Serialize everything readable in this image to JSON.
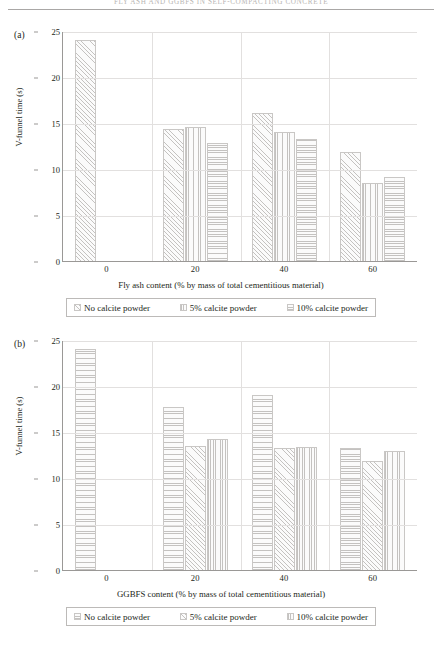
{
  "page": {
    "running_head": "FLY ASH AND GGBFS IN SELF-COMPACTING CONCRETE"
  },
  "chart_data": [
    {
      "type": "bar",
      "panel_label": "(a)",
      "title": "",
      "xlabel": "Fly ash content (% by mass of total cementitious material)",
      "ylabel": "V-funnel time (s)",
      "categories": [
        "0",
        "20",
        "40",
        "60"
      ],
      "ylim": [
        0,
        25
      ],
      "yticks": [
        0,
        5,
        10,
        15,
        20,
        25
      ],
      "grid": true,
      "legend_position": "below",
      "series": [
        {
          "name": "No calcite powder",
          "pattern": "diagonal",
          "values": [
            24.0,
            14.4,
            16.1,
            11.8
          ]
        },
        {
          "name": "5% calcite powder",
          "pattern": "vertical",
          "values": [
            null,
            14.6,
            14.0,
            8.5
          ]
        },
        {
          "name": "10% calcite powder",
          "pattern": "horizontal",
          "values": [
            null,
            12.8,
            13.3,
            9.1
          ]
        }
      ]
    },
    {
      "type": "bar",
      "panel_label": "(b)",
      "title": "",
      "xlabel": "GGBFS content (% by mass of total cementitious material)",
      "ylabel": "V-funnel time (s)",
      "categories": [
        "0",
        "20",
        "40",
        "60"
      ],
      "ylim": [
        0,
        25
      ],
      "yticks": [
        0,
        5,
        10,
        15,
        20,
        25
      ],
      "grid": true,
      "legend_position": "below",
      "series": [
        {
          "name": "No calcite powder",
          "pattern": "horizontal",
          "values": [
            24.0,
            17.7,
            19.0,
            13.3
          ]
        },
        {
          "name": "5% calcite powder",
          "pattern": "diagonal",
          "values": [
            null,
            13.5,
            13.3,
            11.9
          ]
        },
        {
          "name": "10% calcite powder",
          "pattern": "vertical",
          "values": [
            null,
            14.2,
            13.4,
            12.9
          ]
        }
      ]
    }
  ]
}
